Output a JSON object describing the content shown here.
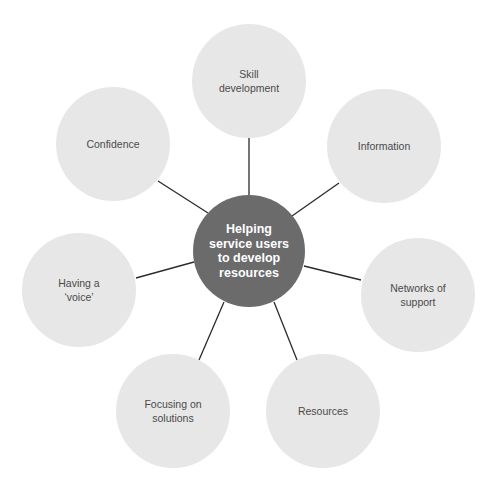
{
  "diagram": {
    "type": "hub-and-spoke",
    "center": {
      "label": "Helping\nservice users\nto develop\nresources",
      "color": "#6b6b6b",
      "text_color": "#ffffff"
    },
    "nodes": [
      {
        "id": "skill-development",
        "label": "Skill\ndevelopment"
      },
      {
        "id": "information",
        "label": "Information"
      },
      {
        "id": "networks-of-support",
        "label": "Networks of\nsupport"
      },
      {
        "id": "resources",
        "label": "Resources"
      },
      {
        "id": "focusing-on-solutions",
        "label": "Focusing on\nsolutions"
      },
      {
        "id": "having-a-voice",
        "label": "Having a\n‘voice’"
      },
      {
        "id": "confidence",
        "label": "Confidence"
      }
    ],
    "node_color": "#e7e7e7",
    "node_text_color": "#4a4a4a",
    "connector_color": "#2b2b2b"
  }
}
